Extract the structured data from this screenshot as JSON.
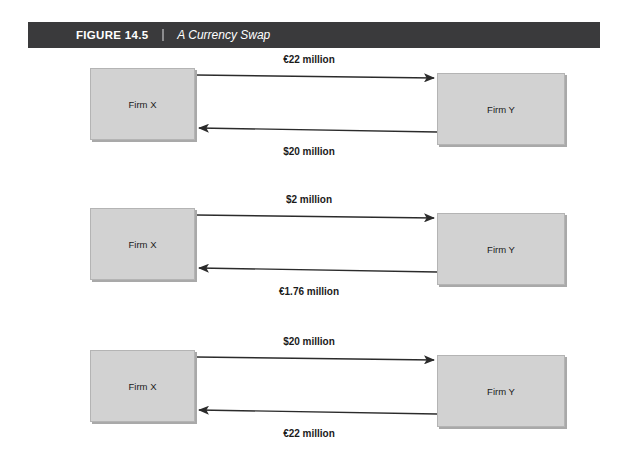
{
  "figure": {
    "number": "FIGURE 14.5",
    "divider": "|",
    "title": "A Currency Swap"
  },
  "colors": {
    "header_bar": "#3a3a3c",
    "header_text": "#ffffff",
    "box_fill": "#d2d2d2",
    "box_border": "#b4b4b4",
    "box_shadow": "#a9a9a9",
    "arrow": "#2b2b2b",
    "page_background": "#ffffff"
  },
  "diagram": {
    "left_firm": "Firm X",
    "right_firm": "Firm Y",
    "rows": [
      {
        "top_label": "€22 million",
        "bottom_label": "$20 million",
        "top_direction": "right",
        "bottom_direction": "left"
      },
      {
        "top_label": "$2 million",
        "bottom_label": "€1.76 million",
        "top_direction": "right",
        "bottom_direction": "left"
      },
      {
        "top_label": "$20 million",
        "bottom_label": "€22 million",
        "top_direction": "right",
        "bottom_direction": "left"
      }
    ]
  }
}
